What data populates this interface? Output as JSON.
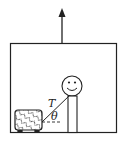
{
  "diagram": {
    "labels": {
      "tension": "T",
      "angle": "θ"
    },
    "colors": {
      "stroke": "#222222",
      "background": "#ffffff"
    }
  }
}
